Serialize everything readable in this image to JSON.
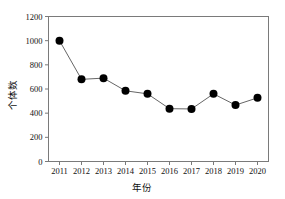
{
  "chart_data": {
    "type": "line",
    "title": "",
    "subtitle": "",
    "xlabel": "年份",
    "ylabel": "个体数",
    "categories": [
      "2011",
      "2012",
      "2013",
      "2014",
      "2015",
      "2016",
      "2017",
      "2018",
      "2019",
      "2020"
    ],
    "values": [
      1000,
      680,
      690,
      585,
      560,
      437,
      435,
      560,
      467,
      527
    ],
    "series": [
      {
        "name": "个体数",
        "values": [
          1000,
          680,
          690,
          585,
          560,
          437,
          435,
          560,
          467,
          527
        ]
      }
    ],
    "xlim": [
      2010.5,
      2020.5
    ],
    "ylim": [
      0,
      1200
    ],
    "ytick_labels": [
      "0",
      "200",
      "400",
      "600",
      "800",
      "1000",
      "1200"
    ],
    "ytick_values": [
      0,
      200,
      400,
      600,
      800,
      1000,
      1200
    ],
    "xtick_labels": [
      "2011",
      "2012",
      "2013",
      "2014",
      "2015",
      "2016",
      "2017",
      "2018",
      "2019",
      "2020"
    ],
    "grid": false,
    "legend": false,
    "legend_position": "none",
    "marker": "filled-circle",
    "marker_color": "#000000",
    "line_color": "#666666",
    "frame_color": "#7a7a7a",
    "background": "#ffffff",
    "annotations": []
  }
}
